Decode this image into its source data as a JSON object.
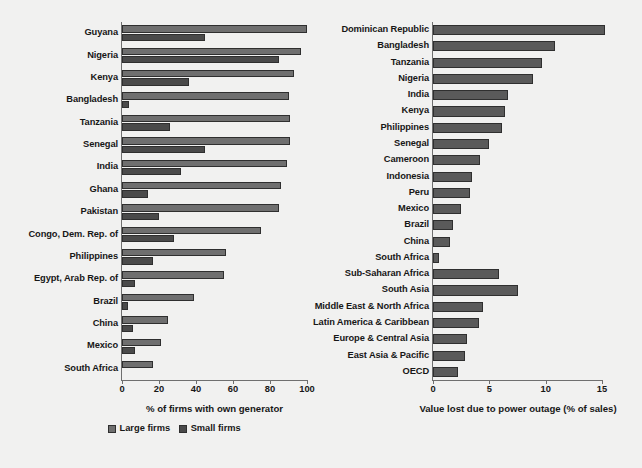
{
  "figure": {
    "background_color": "#f1f1f0",
    "large_firms_color": "#6f6f6f",
    "small_firms_color": "#4a4a4a",
    "single_series_color": "#5a5a5a"
  },
  "legend": {
    "items": [
      {
        "label": "Large firms",
        "swatch": "large"
      },
      {
        "label": "Small firms",
        "swatch": "small"
      }
    ]
  },
  "chart_data": [
    {
      "id": "own-generator",
      "type": "bar",
      "orientation": "horizontal",
      "title": "",
      "xlabel": "% of firms with own generator",
      "ylabel": "",
      "xlim": [
        0,
        100
      ],
      "xticks": [
        0,
        20,
        40,
        60,
        80,
        100
      ],
      "xticklabels": [
        "0",
        "20",
        "40",
        "60",
        "80",
        "100"
      ],
      "grid": false,
      "legend_position": "bottom",
      "categories": [
        "Guyana",
        "Nigeria",
        "Kenya",
        "Bangladesh",
        "Tanzania",
        "Senegal",
        "India",
        "Ghana",
        "Pakistan",
        "Congo, Dem. Rep. of",
        "Philippines",
        "Egypt, Arab Rep. of",
        "Brazil",
        "China",
        "Mexico",
        "South Africa"
      ],
      "series": [
        {
          "name": "Large firms",
          "color": "#6f6f6f",
          "values": [
            100,
            97,
            93,
            90,
            91,
            91,
            89,
            86,
            85,
            75,
            56,
            55,
            39,
            25,
            21,
            17
          ]
        },
        {
          "name": "Small firms",
          "color": "#4a4a4a",
          "values": [
            45,
            85,
            36,
            4,
            26,
            45,
            32,
            14,
            20,
            28,
            17,
            7,
            3,
            6,
            7,
            0
          ]
        }
      ]
    },
    {
      "id": "value-lost-power-outage",
      "type": "bar",
      "orientation": "horizontal",
      "title": "",
      "xlabel": "Value lost due to power outage (% of sales)",
      "ylabel": "",
      "xlim": [
        0,
        15
      ],
      "xticks": [
        0,
        5,
        10,
        15
      ],
      "xticklabels": [
        "0",
        "5",
        "10",
        "15"
      ],
      "grid": false,
      "legend_position": "none",
      "categories": [
        "Dominican Republic",
        "Bangladesh",
        "Tanzania",
        "Nigeria",
        "India",
        "Kenya",
        "Philippines",
        "Senegal",
        "Cameroon",
        "Indonesia",
        "Peru",
        "Mexico",
        "Brazil",
        "China",
        "South Africa",
        "Sub-Saharan Africa",
        "South Asia",
        "Middle East & North Africa",
        "Latin America & Caribbean",
        "Europe & Central Asia",
        "East Asia & Pacific",
        "OECD"
      ],
      "series": [
        {
          "name": "Value lost due to power outage",
          "color": "#5a5a5a",
          "values": [
            15.3,
            10.8,
            9.7,
            8.9,
            6.7,
            6.4,
            6.1,
            5.0,
            4.2,
            3.5,
            3.3,
            2.5,
            1.8,
            1.5,
            0.5,
            5.9,
            7.5,
            4.4,
            4.1,
            3.0,
            2.8,
            2.2
          ]
        }
      ]
    }
  ]
}
